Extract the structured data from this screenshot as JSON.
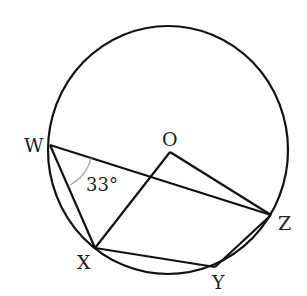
{
  "diagram": {
    "type": "circle-geometry",
    "circle": {
      "center_label": "O"
    },
    "points": {
      "W": {
        "label": "W"
      },
      "O": {
        "label": "O"
      },
      "Z": {
        "label": "Z"
      },
      "X": {
        "label": "X"
      },
      "Y": {
        "label": "Y"
      }
    },
    "segments": [
      "WZ",
      "WX",
      "XO",
      "OZ",
      "XY",
      "YZ"
    ],
    "angle_marks": [
      {
        "vertex": "W",
        "between": [
          "X",
          "Z"
        ],
        "label": "33°"
      }
    ],
    "colors": {
      "stroke": "#111111",
      "arc": "#aaaaaa",
      "text": "#222222"
    }
  }
}
